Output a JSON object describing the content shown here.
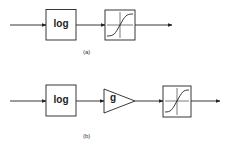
{
  "diagram_a": {
    "caption": "(a)",
    "blocks": [
      {
        "type": "box",
        "label": "log"
      },
      {
        "type": "box",
        "label": "",
        "icon": "sigmoid-icon"
      }
    ]
  },
  "diagram_b": {
    "caption": "(b)",
    "blocks": [
      {
        "type": "box",
        "label": "log"
      },
      {
        "type": "triangle",
        "label": "g"
      },
      {
        "type": "box",
        "label": "",
        "icon": "sigmoid-icon"
      }
    ]
  }
}
